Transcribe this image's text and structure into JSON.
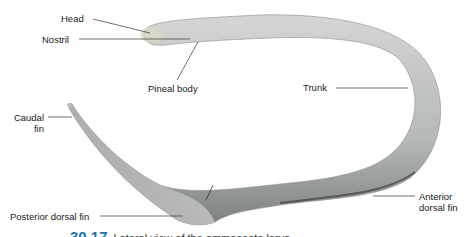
{
  "figure": {
    "labels": {
      "head": "Head",
      "nostril": "Nostril",
      "pineal_body": "Pineal body",
      "trunk": "Trunk",
      "caudal_fin_line1": "Caudal",
      "caudal_fin_line2": "fin",
      "posterior_dorsal_fin": "Posterior dorsal fin",
      "anterior_dorsal_fin_line1": "Anterior",
      "anterior_dorsal_fin_line2": "dorsal fin"
    },
    "caption": {
      "number": "30.17",
      "text": "Lateral view of the ammocoete larva"
    },
    "colors": {
      "body": "#b9bcbc",
      "body_dark": "#6f7272",
      "caption_blue": "#1f6fb3",
      "leader_line": "#333333"
    }
  }
}
